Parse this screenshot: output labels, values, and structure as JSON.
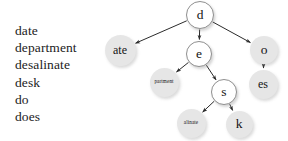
{
  "figure": {
    "background": "#ffffff"
  },
  "word_list": {
    "name": "word-list",
    "words": [
      "date",
      "department",
      "desalinate",
      "desk",
      "do",
      "does"
    ]
  },
  "tree": {
    "type": "compressed-trie",
    "colors": {
      "internal_fill": "#ffffff",
      "internal_stroke": "#8f8f8f",
      "leaf_fill": "#e6e6e6",
      "edge": "#2b2b2b",
      "text": "#141414"
    },
    "nodes": [
      {
        "id": "root",
        "label": "d",
        "kind": "internal",
        "cx": 200,
        "cy": 15,
        "r": 14,
        "size": "lg"
      },
      {
        "id": "ate",
        "label": "ate",
        "kind": "leaf",
        "cx": 120,
        "cy": 50,
        "r": 15.5,
        "size": "md"
      },
      {
        "id": "e",
        "label": "e",
        "kind": "internal",
        "cx": 199,
        "cy": 54,
        "r": 13,
        "size": "lg"
      },
      {
        "id": "o",
        "label": "o",
        "kind": "leaf",
        "cx": 264,
        "cy": 50,
        "r": 14,
        "size": "lg"
      },
      {
        "id": "partment",
        "label": "partment",
        "kind": "leaf",
        "cx": 164,
        "cy": 82,
        "r": 14.5,
        "size": "tiny"
      },
      {
        "id": "s",
        "label": "s",
        "kind": "internal",
        "cx": 224,
        "cy": 92,
        "r": 13,
        "size": "lg"
      },
      {
        "id": "es",
        "label": "es",
        "kind": "leaf",
        "cx": 263,
        "cy": 84,
        "r": 14.5,
        "size": "md"
      },
      {
        "id": "alinate",
        "label": "alinate",
        "kind": "leaf",
        "cx": 191,
        "cy": 123,
        "r": 14.5,
        "size": "tiny"
      },
      {
        "id": "k",
        "label": "k",
        "kind": "leaf",
        "cx": 239,
        "cy": 124,
        "r": 13.5,
        "size": "lg"
      }
    ],
    "edges": [
      {
        "from": "root",
        "to": "ate"
      },
      {
        "from": "root",
        "to": "e"
      },
      {
        "from": "root",
        "to": "o"
      },
      {
        "from": "e",
        "to": "partment"
      },
      {
        "from": "e",
        "to": "s"
      },
      {
        "from": "o",
        "to": "es"
      },
      {
        "from": "s",
        "to": "alinate"
      },
      {
        "from": "s",
        "to": "k"
      }
    ]
  }
}
